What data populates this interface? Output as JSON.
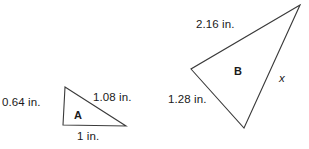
{
  "figure": {
    "background_color": "#ffffff",
    "stroke_color": "#3a3a3a",
    "text_color": "#1a1a1a",
    "triangle_a": {
      "name": "A",
      "vertices": [
        [
          65,
          87
        ],
        [
          63,
          125
        ],
        [
          126,
          126
        ]
      ],
      "sides": {
        "left": "0.64 in.",
        "hypotenuse": "1.08 in.",
        "base": "1 in."
      }
    },
    "triangle_b": {
      "name": "B",
      "vertices": [
        [
          300,
          5
        ],
        [
          191,
          69
        ],
        [
          244,
          128
        ]
      ],
      "sides": {
        "top": "2.16 in.",
        "left": "1.28 in.",
        "right": "x"
      }
    }
  }
}
